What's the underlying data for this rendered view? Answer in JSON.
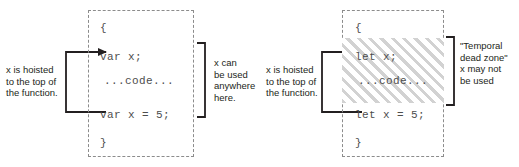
{
  "figure": {
    "type": "diagram",
    "panels": [
      {
        "id": "var-panel",
        "keyword": "var",
        "code": {
          "open_brace": "{",
          "declaration": "var x;",
          "body": "...code...",
          "assignment": "var x = 5;",
          "close_brace": "}"
        },
        "hoist_note": "x is hoisted\nto the top of\nthe function.",
        "span_note": "x can\nbe used\nanywhere\nhere.",
        "has_dead_zone": false
      },
      {
        "id": "let-panel",
        "keyword": "let",
        "code": {
          "open_brace": "{",
          "declaration": "let x;",
          "body": "...code...",
          "assignment": "let x = 5;",
          "close_brace": "}"
        },
        "hoist_note": "x is hoisted\nto the top of\nthe function.",
        "span_note": "\"Temporal\ndead zone\"\nx may not\nbe used",
        "has_dead_zone": true
      }
    ]
  },
  "colors": {
    "background": "#ffffff",
    "text": "#231f20",
    "code_text": "#4d4d4d",
    "dashed_border": "#8c8c8c",
    "arrow": "#231f20",
    "hatch_stripe": "#d2d2d2"
  }
}
